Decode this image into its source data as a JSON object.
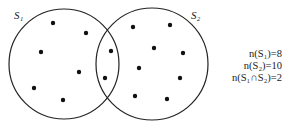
{
  "diagram": {
    "type": "venn",
    "sets": [
      {
        "label": "S1",
        "label_display": "S₁",
        "count": 8
      },
      {
        "label": "S2",
        "label_display": "S₂",
        "count": 10
      }
    ],
    "intersection_count": 2,
    "equations": [
      "n(S₁)=8",
      "n(S₂)=10",
      "n(S₁∩S₂)=2"
    ],
    "colors": {
      "stroke": "#222222",
      "dot": "#111111",
      "background": "#ffffff"
    }
  }
}
